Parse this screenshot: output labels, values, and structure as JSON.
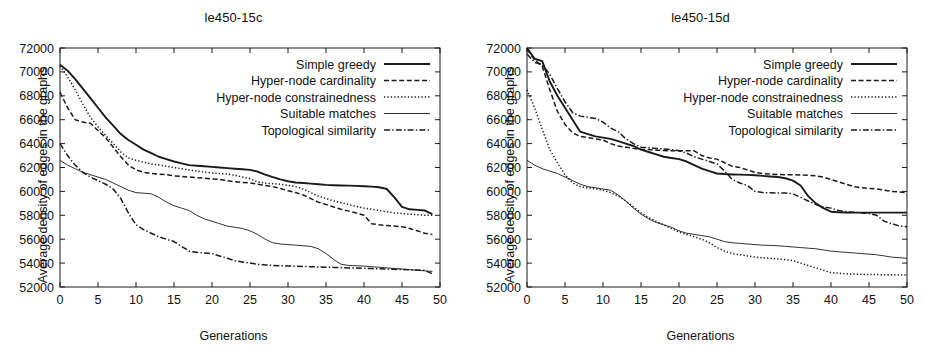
{
  "figure": {
    "background": "#ffffff",
    "ink": "#1a1a1a"
  },
  "axis_common": {
    "ylabel": "Average density of edges in the graphs",
    "xlabel": "Generations",
    "ylim": [
      52000,
      72000
    ],
    "xlim": [
      0,
      50
    ],
    "yticks": [
      52000,
      54000,
      56000,
      58000,
      60000,
      62000,
      64000,
      66000,
      68000,
      70000,
      72000
    ],
    "xticks": [
      0,
      5,
      10,
      15,
      20,
      25,
      30,
      35,
      40,
      45,
      50
    ],
    "ytick_labels": [
      "52000",
      "54000",
      "56000",
      "58000",
      "60000",
      "62000",
      "64000",
      "66000",
      "68000",
      "70000",
      "72000"
    ],
    "xtick_labels": [
      "0",
      "5",
      "10",
      "15",
      "20",
      "25",
      "30",
      "35",
      "40",
      "45",
      "50"
    ],
    "grid": false,
    "legend_position": "top-right"
  },
  "legend": {
    "entries": [
      {
        "label": "Simple greedy",
        "style": "solid",
        "width": 1.9
      },
      {
        "label": "Hyper-node cardinality",
        "style": "dashed",
        "width": 1.4
      },
      {
        "label": "Hyper-node constrainedness",
        "style": "dotted",
        "width": 1.4
      },
      {
        "label": "Suitable matches",
        "style": "thin-solid",
        "width": 0.9
      },
      {
        "label": "Topological similarity",
        "style": "dash-dot",
        "width": 1.4
      }
    ]
  },
  "chart_data": [
    {
      "type": "line",
      "title": "le450-15c",
      "xlabel": "Generations",
      "ylabel": "Average density of edges in the graphs",
      "xlim": [
        0,
        50
      ],
      "ylim": [
        52000,
        72000
      ],
      "grid": false,
      "legend_position": "top-right",
      "x": [
        0,
        1,
        2,
        3,
        4,
        5,
        6,
        7,
        8,
        9,
        10,
        11,
        12,
        13,
        14,
        15,
        16,
        17,
        18,
        19,
        20,
        21,
        22,
        23,
        24,
        25,
        26,
        27,
        28,
        29,
        30,
        31,
        32,
        33,
        34,
        35,
        36,
        37,
        38,
        39,
        40,
        41,
        42,
        43,
        44,
        45,
        46,
        47,
        48,
        49
      ],
      "series": [
        {
          "name": "Simple greedy",
          "style": "solid",
          "values": [
            70600,
            70100,
            69400,
            68600,
            67800,
            67000,
            66200,
            65500,
            64800,
            64300,
            63900,
            63500,
            63200,
            62900,
            62700,
            62500,
            62350,
            62200,
            62150,
            62100,
            62050,
            62000,
            61950,
            61900,
            61850,
            61800,
            61650,
            61400,
            61200,
            61000,
            60850,
            60750,
            60700,
            60650,
            60600,
            60550,
            60520,
            60500,
            60480,
            60460,
            60430,
            60400,
            60350,
            60200,
            59500,
            58700,
            58500,
            58450,
            58400,
            58100
          ]
        },
        {
          "name": "Hyper-node cardinality",
          "style": "dashed",
          "values": [
            68300,
            67000,
            66000,
            65800,
            65700,
            65100,
            64500,
            63700,
            62900,
            62200,
            61800,
            61600,
            61500,
            61450,
            61400,
            61300,
            61250,
            61200,
            61150,
            61100,
            61050,
            61000,
            60900,
            60800,
            60750,
            60700,
            60600,
            60500,
            60400,
            60250,
            60050,
            59900,
            59700,
            59400,
            59100,
            58900,
            58700,
            58500,
            58350,
            58200,
            58000,
            57300,
            57200,
            57150,
            57100,
            57050,
            56900,
            56700,
            56500,
            56400
          ]
        },
        {
          "name": "Hyper-node constrainedness",
          "style": "dotted",
          "values": [
            70500,
            69600,
            68500,
            67300,
            66200,
            65400,
            64700,
            64000,
            63300,
            62800,
            62600,
            62450,
            62300,
            62200,
            62100,
            62000,
            61900,
            61800,
            61700,
            61600,
            61550,
            61500,
            61450,
            61350,
            61200,
            61050,
            60800,
            60700,
            60650,
            60600,
            60500,
            60400,
            60200,
            59900,
            59600,
            59400,
            59200,
            59050,
            58900,
            58750,
            58600,
            58500,
            58400,
            58300,
            58200,
            58150,
            58100,
            58050,
            58000,
            58000
          ]
        },
        {
          "name": "Suitable matches",
          "style": "thin-solid",
          "values": [
            62600,
            62200,
            61900,
            61600,
            61400,
            61200,
            61000,
            60700,
            60400,
            60100,
            59900,
            59850,
            59800,
            59500,
            59100,
            58800,
            58600,
            58400,
            58000,
            57700,
            57500,
            57300,
            57100,
            57000,
            56900,
            56700,
            56400,
            56000,
            55700,
            55600,
            55550,
            55500,
            55450,
            55400,
            55200,
            54800,
            54300,
            53900,
            53800,
            53780,
            53750,
            53700,
            53650,
            53600,
            53550,
            53500,
            53450,
            53400,
            53350,
            53300
          ]
        },
        {
          "name": "Topological similarity",
          "style": "dash-dot",
          "values": [
            64000,
            63000,
            62200,
            61600,
            61200,
            60900,
            60600,
            60200,
            59400,
            58200,
            57200,
            56800,
            56500,
            56200,
            56000,
            55800,
            55400,
            55000,
            54900,
            54850,
            54800,
            54600,
            54400,
            54200,
            54100,
            54000,
            53900,
            53850,
            53800,
            53780,
            53760,
            53740,
            53720,
            53700,
            53680,
            53660,
            53640,
            53620,
            53600,
            53580,
            53560,
            53540,
            53520,
            53500,
            53480,
            53460,
            53440,
            53420,
            53400,
            53100
          ]
        }
      ]
    },
    {
      "type": "line",
      "title": "le450-15d",
      "xlabel": "Generations",
      "ylabel": "Average density of edges in the graphs",
      "xlim": [
        0,
        50
      ],
      "ylim": [
        52000,
        72000
      ],
      "grid": false,
      "legend_position": "top-right",
      "x": [
        0,
        1,
        2,
        3,
        4,
        5,
        6,
        7,
        8,
        9,
        10,
        11,
        12,
        13,
        14,
        15,
        16,
        17,
        18,
        19,
        20,
        21,
        22,
        23,
        24,
        25,
        26,
        27,
        28,
        29,
        30,
        31,
        32,
        33,
        34,
        35,
        36,
        37,
        38,
        39,
        40,
        41,
        42,
        43,
        44,
        45,
        46,
        47,
        48,
        49,
        50
      ],
      "series": [
        {
          "name": "Simple greedy",
          "style": "solid",
          "values": [
            72000,
            71100,
            70900,
            69200,
            68000,
            67000,
            66000,
            65000,
            64800,
            64600,
            64500,
            64400,
            64200,
            64000,
            63800,
            63500,
            63300,
            63100,
            62900,
            62800,
            62700,
            62500,
            62200,
            61900,
            61700,
            61500,
            61450,
            61420,
            61400,
            61380,
            61350,
            61300,
            61250,
            61200,
            61100,
            60900,
            60500,
            59600,
            59000,
            58600,
            58300,
            58250,
            58230,
            58220,
            58220,
            58220,
            58220,
            58220,
            58220,
            58220,
            58220
          ]
        },
        {
          "name": "Hyper-node cardinality",
          "style": "dashed",
          "values": [
            71900,
            71000,
            70500,
            68500,
            66700,
            65600,
            64900,
            64600,
            64500,
            64400,
            64300,
            64000,
            63800,
            63700,
            63600,
            63500,
            63500,
            63450,
            63420,
            63400,
            63400,
            63400,
            63400,
            63000,
            62800,
            62700,
            62400,
            62100,
            62000,
            61800,
            61600,
            61500,
            61450,
            61420,
            61400,
            61400,
            61380,
            61350,
            61300,
            61200,
            61000,
            60800,
            60600,
            60400,
            60300,
            60250,
            60200,
            60100,
            60000,
            59950,
            59900
          ]
        },
        {
          "name": "Hyper-node constrainedness",
          "style": "dotted",
          "values": [
            68500,
            67000,
            65200,
            63500,
            62400,
            61400,
            60700,
            60400,
            60300,
            60200,
            60100,
            59900,
            59600,
            59200,
            58700,
            58200,
            57800,
            57500,
            57200,
            56900,
            56600,
            56400,
            56200,
            56000,
            55700,
            55300,
            55000,
            54800,
            54700,
            54600,
            54500,
            54450,
            54400,
            54350,
            54300,
            54200,
            54000,
            53800,
            53600,
            53400,
            53200,
            53150,
            53100,
            53080,
            53060,
            53050,
            53040,
            53030,
            53020,
            53010,
            53000
          ]
        },
        {
          "name": "Suitable matches",
          "style": "thin-solid",
          "values": [
            62600,
            62200,
            61900,
            61700,
            61500,
            61200,
            60900,
            60600,
            60400,
            60300,
            60200,
            60100,
            59700,
            59200,
            58600,
            58100,
            57700,
            57400,
            57200,
            57000,
            56700,
            56500,
            56400,
            56300,
            56200,
            56000,
            55800,
            55700,
            55650,
            55600,
            55550,
            55500,
            55480,
            55450,
            55400,
            55350,
            55300,
            55250,
            55200,
            55100,
            55000,
            54950,
            54900,
            54850,
            54800,
            54750,
            54700,
            54600,
            54500,
            54450,
            54400
          ]
        },
        {
          "name": "Topological similarity",
          "style": "dash-dot",
          "values": [
            71500,
            70800,
            70600,
            69800,
            68600,
            67500,
            66600,
            66300,
            66200,
            66100,
            65800,
            65300,
            65000,
            64400,
            64000,
            63700,
            63650,
            63600,
            63550,
            63500,
            63400,
            63200,
            62900,
            62700,
            62500,
            62300,
            61700,
            61000,
            60700,
            60500,
            60000,
            59900,
            59880,
            59870,
            59860,
            59800,
            59500,
            59200,
            58900,
            58700,
            58600,
            58400,
            58300,
            58250,
            58200,
            58150,
            58000,
            57500,
            57300,
            57100,
            57050
          ]
        }
      ]
    }
  ]
}
